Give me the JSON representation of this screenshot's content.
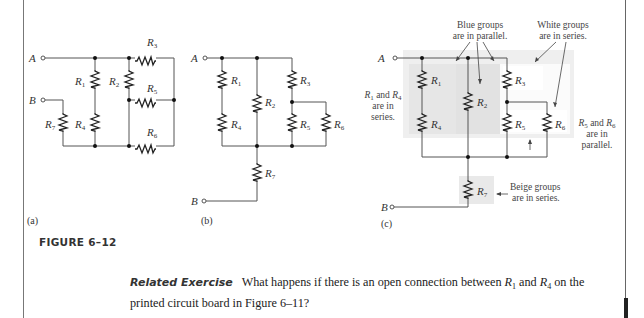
{
  "figure": {
    "caption": "FIGURE 6–12",
    "panels": [
      {
        "id": "a",
        "label": "(a)"
      },
      {
        "id": "b",
        "label": "(b)"
      },
      {
        "id": "c",
        "label": "(c)"
      }
    ],
    "terminals": {
      "a": "A",
      "b": "B"
    },
    "resistors": [
      "R1",
      "R2",
      "R3",
      "R4",
      "R5",
      "R6",
      "R7"
    ],
    "shading_colors": {
      "blue_group": "#e4e4e4",
      "white_group": "#ffffff",
      "beige_group": "#e9e9e9",
      "outer_group": "#efefef"
    },
    "annotations": {
      "blue_groups": [
        "Blue groups",
        "are in parallel."
      ],
      "white_groups": [
        "White groups",
        "are in series."
      ],
      "r1_r4": [
        "and",
        "are in",
        "series."
      ],
      "r5_r6": [
        "and",
        "are in",
        "parallel."
      ],
      "beige_groups": [
        "Beige groups",
        "are in series."
      ]
    }
  },
  "related_exercise": {
    "label": "Related Exercise",
    "text_before": "What happens if there is an open connection between",
    "r1": "R",
    "r1_sub": "1",
    "and": "and",
    "r4": "R",
    "r4_sub": "4",
    "text_after": "on the printed circuit board in Figure 6–11?"
  }
}
